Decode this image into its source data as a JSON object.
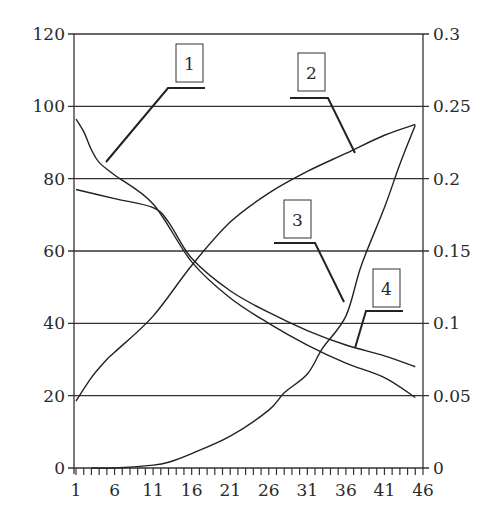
{
  "chart_data": {
    "type": "line",
    "title": "",
    "xlabel": "",
    "ylabel": "",
    "y2label": "",
    "x_ticks": [
      1,
      6,
      11,
      16,
      21,
      26,
      31,
      36,
      41,
      46
    ],
    "xlim": [
      1,
      46
    ],
    "ylim": [
      0,
      120
    ],
    "y_ticks": [
      0,
      20,
      40,
      60,
      80,
      100,
      120
    ],
    "y2lim": [
      0,
      0.3
    ],
    "y2_ticks": [
      "0",
      "0.05",
      "0.1",
      "0.15",
      "0.2",
      "0.25",
      "0.3"
    ],
    "grid": "horizontal",
    "legend": "numbered callouts",
    "series": [
      {
        "name": "1",
        "axis": "left",
        "x": [
          1,
          2,
          3,
          4,
          6,
          11,
          16,
          21,
          26,
          31,
          36,
          41,
          45
        ],
        "values": [
          96.5,
          93,
          88,
          84.5,
          81,
          73,
          57,
          47,
          40,
          34,
          29,
          25,
          19.5
        ]
      },
      {
        "name": "2",
        "axis": "left",
        "x": [
          1,
          3,
          5,
          6,
          11,
          16,
          21,
          26,
          31,
          36,
          41,
          45
        ],
        "values": [
          18.5,
          25,
          30,
          32,
          42,
          56,
          68,
          76,
          82,
          87,
          92,
          95
        ]
      },
      {
        "name": "3",
        "axis": "left",
        "x": [
          1,
          6,
          11,
          13,
          16,
          21,
          26,
          31,
          36,
          41,
          45
        ],
        "values": [
          77,
          74.5,
          72,
          68,
          58,
          49,
          43,
          38,
          34,
          31,
          28
        ]
      },
      {
        "name": "4",
        "axis": "right",
        "x": [
          3,
          6,
          11,
          13,
          16,
          21,
          26,
          28,
          31,
          33,
          36,
          38,
          41,
          43,
          45
        ],
        "values": [
          0.0,
          0.0,
          0.002,
          0.004,
          0.01,
          0.022,
          0.04,
          0.052,
          0.065,
          0.083,
          0.105,
          0.14,
          0.18,
          0.21,
          0.237
        ]
      }
    ],
    "callouts": [
      {
        "label": "1",
        "series": "1"
      },
      {
        "label": "2",
        "series": "2"
      },
      {
        "label": "3",
        "series": "3"
      },
      {
        "label": "4",
        "series": "4"
      }
    ]
  }
}
